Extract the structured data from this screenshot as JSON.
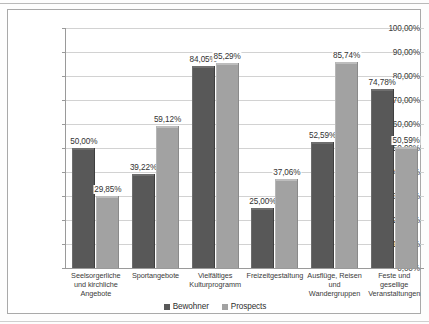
{
  "chart_data": {
    "type": "bar",
    "title": "",
    "subtitle": "",
    "xlabel": "",
    "ylabel": "",
    "ylim": [
      0,
      100
    ],
    "yunit": "%",
    "grid": true,
    "legend_position": "bottom",
    "ytick_labels": [
      "100,00%",
      "90,00%",
      "80,00%",
      "70,00%",
      "60,00%",
      "50,00%",
      "40,00%",
      "30,00%",
      "20,00%",
      "10,00%",
      "0,00%"
    ],
    "ytick_values": [
      100,
      90,
      80,
      70,
      60,
      50,
      40,
      30,
      20,
      10,
      0
    ],
    "categories": [
      "Seelsorgerliche und kirchliche Angebote",
      "Sportangebote",
      "Vielfältiges Kulturprogramm",
      "Freizeitgestaltung",
      "Ausflüge, Reisen und Wandergruppen",
      "Feste und gesellige Veranstaltungen"
    ],
    "series": [
      {
        "name": "Bewohner",
        "color": "#585858",
        "values": [
          50.0,
          39.22,
          84.05,
          25.0,
          52.59,
          74.78
        ],
        "labels": [
          "50,00%",
          "39,22%",
          "84,05%",
          "25,00%",
          "52,59%",
          "74,78%"
        ]
      },
      {
        "name": "Prospects",
        "color": "#a2a2a2",
        "values": [
          29.85,
          59.12,
          85.29,
          37.06,
          85.74,
          50.59
        ],
        "labels": [
          "29,85%",
          "59,12%",
          "85,29%",
          "37,06%",
          "85,74%",
          "50,59%"
        ]
      }
    ]
  }
}
